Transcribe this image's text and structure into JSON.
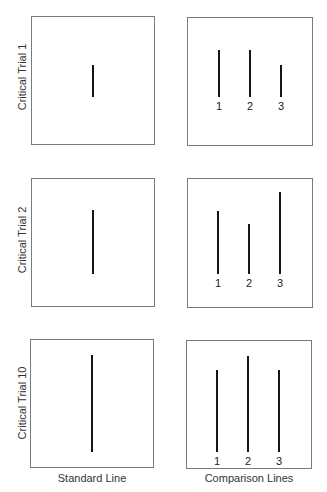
{
  "figure": {
    "captions": {
      "standard": "Standard Line",
      "comparison": "Comparison Lines"
    },
    "trials": [
      {
        "label": "Critical Trial 1",
        "standard": {
          "x": 93,
          "y1": 65,
          "y2": 97
        },
        "box_left": {
          "x": 31,
          "y": 16,
          "w": 124,
          "h": 129
        },
        "box_right": {
          "x": 187,
          "y": 17,
          "w": 126,
          "h": 129
        },
        "comparison": [
          {
            "num": "1",
            "x": 219,
            "y1": 50,
            "y2": 97
          },
          {
            "num": "2",
            "x": 250,
            "y1": 50,
            "y2": 97
          },
          {
            "num": "3",
            "x": 281,
            "y1": 65,
            "y2": 97
          }
        ],
        "num_y": 100,
        "label_x": 22,
        "label_y": 77
      },
      {
        "label": "Critical Trial 2",
        "standard": {
          "x": 93,
          "y1": 210,
          "y2": 274
        },
        "box_left": {
          "x": 31,
          "y": 178,
          "w": 124,
          "h": 129
        },
        "box_right": {
          "x": 187,
          "y": 178,
          "w": 126,
          "h": 130
        },
        "comparison": [
          {
            "num": "1",
            "x": 218,
            "y1": 211,
            "y2": 274
          },
          {
            "num": "2",
            "x": 249,
            "y1": 224,
            "y2": 274
          },
          {
            "num": "3",
            "x": 280,
            "y1": 192,
            "y2": 274
          }
        ],
        "num_y": 277,
        "label_x": 22,
        "label_y": 240
      },
      {
        "label": "Critical Trial 10",
        "standard": {
          "x": 92,
          "y1": 355,
          "y2": 452
        },
        "box_left": {
          "x": 30,
          "y": 339,
          "w": 124,
          "h": 129
        },
        "box_right": {
          "x": 186,
          "y": 340,
          "w": 126,
          "h": 129
        },
        "comparison": [
          {
            "num": "1",
            "x": 217,
            "y1": 370,
            "y2": 452
          },
          {
            "num": "2",
            "x": 248,
            "y1": 356,
            "y2": 452
          },
          {
            "num": "3",
            "x": 279,
            "y1": 370,
            "y2": 452
          }
        ],
        "num_y": 455,
        "label_x": 22,
        "label_y": 403
      }
    ]
  }
}
